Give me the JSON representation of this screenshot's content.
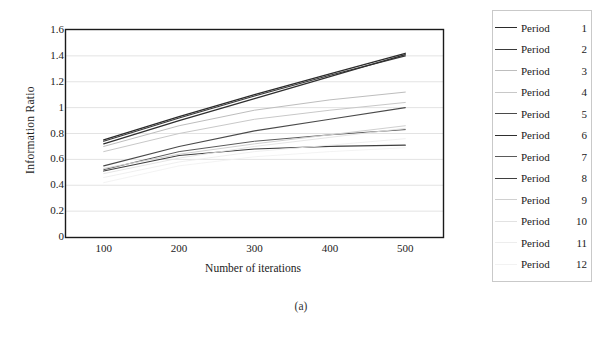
{
  "caption": "(a)",
  "chart_data": {
    "type": "line",
    "title": "",
    "xlabel": "Number of iterations",
    "ylabel": "Information Ratio",
    "x": [
      100,
      200,
      300,
      400,
      500
    ],
    "xlim": [
      50,
      550
    ],
    "ylim": [
      0,
      1.6
    ],
    "ytick_labels": [
      "0",
      "0.2",
      "0.4",
      "0.6",
      "0.8",
      "1",
      "1.2",
      "1.4",
      "1.6"
    ],
    "ytick_values": [
      0,
      0.2,
      0.4,
      0.6,
      0.8,
      1.0,
      1.2,
      1.4,
      1.6
    ],
    "xtick_labels": [
      "100",
      "200",
      "300",
      "400",
      "500"
    ],
    "grid": "horizontal",
    "legend_position": "right",
    "legend_title_prefix": "Period",
    "series": [
      {
        "name": "Period",
        "number": "1",
        "label": "Period 1",
        "color": "#2b2b2b",
        "width": 1.3,
        "values": [
          0.75,
          0.93,
          1.1,
          1.26,
          1.42
        ]
      },
      {
        "name": "Period",
        "number": "2",
        "label": "Period 2",
        "color": "#3a3a3a",
        "width": 1.2,
        "values": [
          0.74,
          0.92,
          1.09,
          1.25,
          1.4
        ]
      },
      {
        "name": "Period",
        "number": "3",
        "label": "Period 3",
        "color": "#bdbdbd",
        "width": 1.0,
        "values": [
          0.7,
          0.86,
          0.98,
          1.06,
          1.12
        ]
      },
      {
        "name": "Period",
        "number": "4",
        "label": "Period 4",
        "color": "#c8c8c8",
        "width": 1.0,
        "values": [
          0.66,
          0.8,
          0.91,
          0.98,
          1.04
        ]
      },
      {
        "name": "Period",
        "number": "5",
        "label": "Period 5",
        "color": "#4a4a4a",
        "width": 1.1,
        "values": [
          0.55,
          0.7,
          0.82,
          0.91,
          1.0
        ]
      },
      {
        "name": "Period",
        "number": "6",
        "label": "Period 6",
        "color": "#2f2f2f",
        "width": 1.2,
        "values": [
          0.72,
          0.9,
          1.07,
          1.24,
          1.41
        ]
      },
      {
        "name": "Period",
        "number": "7",
        "label": "Period 7",
        "color": "#5a5a5a",
        "width": 1.0,
        "values": [
          0.52,
          0.66,
          0.74,
          0.79,
          0.83
        ]
      },
      {
        "name": "Period",
        "number": "8",
        "label": "Period 8",
        "color": "#3f3f3f",
        "width": 1.2,
        "values": [
          0.51,
          0.63,
          0.68,
          0.7,
          0.71
        ]
      },
      {
        "name": "Period",
        "number": "9",
        "label": "Period 9",
        "color": "#d0d0d0",
        "width": 1.0,
        "values": [
          0.53,
          0.64,
          0.72,
          0.79,
          0.86
        ]
      },
      {
        "name": "Period",
        "number": "10",
        "label": "Period 10",
        "color": "#e2e2e2",
        "width": 0.9,
        "values": [
          0.49,
          0.61,
          0.7,
          0.77,
          0.84
        ]
      },
      {
        "name": "Period",
        "number": "11",
        "label": "Period 11",
        "color": "#ededed",
        "width": 0.9,
        "values": [
          0.46,
          0.58,
          0.66,
          0.71,
          0.76
        ]
      },
      {
        "name": "Period",
        "number": "12",
        "label": "Period 12",
        "color": "#f2f2f2",
        "width": 0.9,
        "values": [
          0.42,
          0.55,
          0.62,
          0.66,
          0.69
        ]
      }
    ]
  }
}
